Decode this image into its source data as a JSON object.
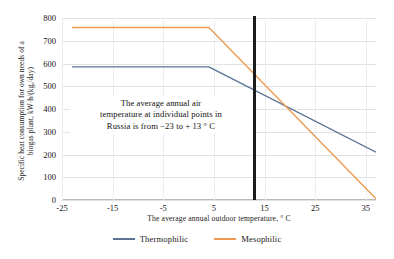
{
  "chart_data": {
    "type": "line",
    "title": "",
    "xlabel": "The average annual outdoor temperature, ° C",
    "ylabel_line1": "Specific heat consumption for own needs of a",
    "ylabel_line2": "biogas plant, kW·h/(kgₑ/day)",
    "xlim": [
      -25,
      37
    ],
    "ylim": [
      0,
      800
    ],
    "xticks": [
      -25,
      -15,
      -5,
      5,
      15,
      25,
      35
    ],
    "xtick_labels": [
      "-25",
      "-15",
      "-5",
      "5",
      "15",
      "25",
      "35"
    ],
    "yticks": [
      0,
      100,
      200,
      300,
      400,
      500,
      600,
      700,
      800
    ],
    "ytick_labels": [
      "0",
      "100",
      "200",
      "300",
      "400",
      "500",
      "600",
      "700",
      "800"
    ],
    "grid": "horizontal-and-vertical",
    "legend_position": "bottom-center",
    "series": [
      {
        "name": "Thermophilic",
        "color": "#5b7394",
        "x": [
          -23,
          4,
          37
        ],
        "values": [
          585,
          585,
          210
        ]
      },
      {
        "name": "Mesophilic",
        "color": "#ed9b52",
        "x": [
          -23,
          4,
          37
        ],
        "values": [
          758,
          758,
          5
        ]
      }
    ],
    "annotations": [
      {
        "name": "russia-temperature-range-note",
        "line1": "The average  annual  air",
        "line2": "temperature  at  individual  points  in",
        "line3": "Russia  is  from  −23  to + 13 ° C"
      },
      {
        "name": "threshold-marker",
        "type": "vertical-line",
        "x_value": 13,
        "color": "#1c1c1c"
      }
    ],
    "intersection_point": {
      "x": 20,
      "y": 405
    }
  },
  "legend": {
    "items": [
      {
        "label": "Thermophilic",
        "color": "#5b7394"
      },
      {
        "label": "Mesophilic",
        "color": "#ed9b52"
      }
    ]
  }
}
